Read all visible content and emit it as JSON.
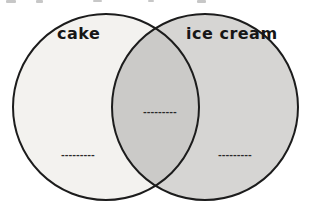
{
  "venn": {
    "left": {
      "label": "cake",
      "fill": "#f3f2ef",
      "blank": "---------"
    },
    "right": {
      "label": "ice cream",
      "fill": "#d6d5d3",
      "blank": "---------"
    },
    "overlap": {
      "fill": "#cbcac8",
      "blank": "---------"
    },
    "outline_color": "#1c1c1c"
  }
}
